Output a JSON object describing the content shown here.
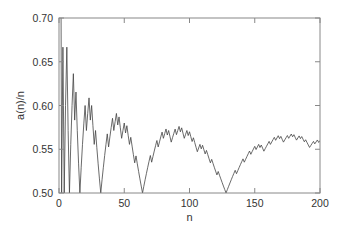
{
  "chart_data": {
    "type": "line",
    "title": "",
    "xlabel": "n",
    "ylabel": "a(n)/n",
    "xlim": [
      0,
      200
    ],
    "ylim": [
      0.5,
      0.7
    ],
    "grid": false,
    "legend": null,
    "x_ticks": [
      0,
      50,
      100,
      150,
      200
    ],
    "x_tick_labels": [
      "0",
      "50",
      "100",
      "150",
      "200"
    ],
    "y_ticks": [
      0.5,
      0.55,
      0.6,
      0.65,
      0.7
    ],
    "y_tick_labels": [
      "0.50",
      "0.55",
      "0.60",
      "0.65",
      "0.70"
    ],
    "series": [
      {
        "name": "a(n)/n",
        "color": "#444444",
        "n_start": 1,
        "a_values": [
          1,
          1,
          2,
          2,
          3,
          4,
          4,
          4,
          5,
          6,
          7,
          7,
          8,
          8,
          8,
          8,
          9,
          10,
          11,
          12,
          12,
          13,
          14,
          14,
          15,
          15,
          15,
          16,
          16,
          16,
          16,
          16,
          17,
          18,
          19,
          20,
          21,
          21,
          22,
          23,
          24,
          24,
          25,
          26,
          26,
          27,
          27,
          27,
          28,
          29,
          29,
          30,
          30,
          30,
          31,
          31,
          31,
          31,
          32,
          32,
          32,
          32,
          32,
          32,
          33,
          34,
          35,
          36,
          37,
          38,
          38,
          39,
          40,
          41,
          42,
          42,
          43,
          44,
          45,
          45,
          46,
          47,
          47,
          48,
          48,
          48,
          49,
          50,
          51,
          51,
          52,
          53,
          53,
          54,
          54,
          54,
          55,
          56,
          56,
          57,
          57,
          57,
          58,
          58,
          58,
          58,
          59,
          60,
          60,
          61,
          61,
          61,
          62,
          62,
          62,
          62,
          63,
          63,
          63,
          63,
          63,
          64,
          64,
          64,
          64,
          64,
          64,
          64,
          65,
          66,
          67,
          68,
          69,
          70,
          71,
          71,
          72,
          73,
          74,
          75,
          76,
          76,
          77,
          78,
          79,
          80,
          80,
          81,
          82,
          83,
          83,
          84,
          85,
          85,
          86,
          86,
          86,
          87,
          88,
          89,
          90,
          90,
          91,
          92,
          93,
          93,
          94,
          95,
          95,
          96,
          96,
          96,
          97,
          98,
          99,
          99,
          100,
          101,
          101,
          102,
          102,
          102,
          103,
          104,
          104,
          105,
          105,
          105,
          106,
          106,
          106,
          106,
          107,
          108,
          109,
          109,
          110,
          111,
          111,
          112
        ]
      }
    ]
  },
  "colors": {
    "axis": "#888888",
    "line": "#444444",
    "text": "#333333",
    "background": "#ffffff"
  }
}
